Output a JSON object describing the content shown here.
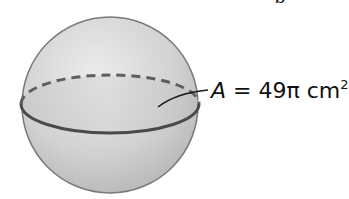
{
  "figure": {
    "type": "sphere",
    "label": {
      "variable": "A",
      "equals": " = ",
      "value": "49π cm",
      "exponent": "2"
    },
    "top_text_cropped": "p",
    "colors": {
      "sphere_fill_light": "#e4e4e4",
      "sphere_fill_dark": "#b8b8b8",
      "outline": "#707070",
      "equator_front": "#4a4a4a",
      "equator_back_dashed": "#606060",
      "leader_line": "#1a1a1a"
    }
  }
}
